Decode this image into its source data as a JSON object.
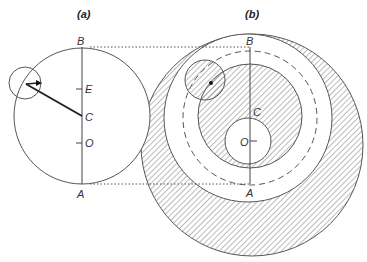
{
  "panels": {
    "a": {
      "title": "(a)",
      "labels": {
        "top": "B",
        "upper_tick": "E",
        "center": "C",
        "lower_tick": "O",
        "bottom": "A"
      }
    },
    "b": {
      "title": "(b)",
      "labels": {
        "top": "B",
        "center": "C",
        "inner": "O",
        "bottom": "A"
      }
    }
  },
  "colors": {
    "stroke": "#555555",
    "hatch": "#777777",
    "background": "#ffffff"
  }
}
